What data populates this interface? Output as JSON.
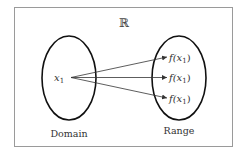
{
  "diagram": {
    "universe_symbol": "ℝ",
    "domain": {
      "label": "Domain",
      "element": "x",
      "element_subscript": "1"
    },
    "range": {
      "label": "Range",
      "elements": [
        {
          "func": "f(x",
          "sub": "1",
          "close": ")"
        },
        {
          "func": "f(x",
          "sub": "1",
          "close": ")"
        },
        {
          "func": "f(x",
          "sub": "1",
          "close": ")"
        }
      ]
    },
    "colors": {
      "frame": "#999999",
      "ellipse": "#111111",
      "arrow": "#333333",
      "text": "#333333"
    }
  }
}
